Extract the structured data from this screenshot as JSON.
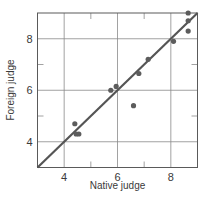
{
  "chart_data": {
    "type": "scatter",
    "title": "",
    "xlabel": "Native judge",
    "ylabel": "Foreign judge",
    "xlim": [
      3,
      9
    ],
    "ylim": [
      3,
      9
    ],
    "x_ticks": [
      4,
      6,
      8
    ],
    "y_ticks": [
      4,
      6,
      8
    ],
    "x_tick_labels": [
      "4",
      "6",
      "8"
    ],
    "y_tick_labels": [
      "4",
      "6",
      "8"
    ],
    "minor_ticks": [
      5,
      7
    ],
    "grid": true,
    "legend": null,
    "series": [
      {
        "name": "judges",
        "x": [
          4.4,
          4.45,
          4.55,
          5.75,
          5.95,
          6.6,
          6.8,
          7.15,
          8.1,
          8.65,
          8.65,
          8.65
        ],
        "y": [
          4.7,
          4.3,
          4.3,
          6.0,
          6.15,
          5.4,
          6.65,
          7.2,
          7.9,
          9.0,
          8.7,
          8.3
        ]
      }
    ],
    "reference_line": {
      "type": "y=x",
      "from": [
        3,
        3
      ],
      "to": [
        9,
        9
      ]
    },
    "colors": {
      "points": "#5c5c5c",
      "line": "#555555",
      "grid": "#8a8a8a",
      "frame": "#5a5a5a"
    }
  }
}
